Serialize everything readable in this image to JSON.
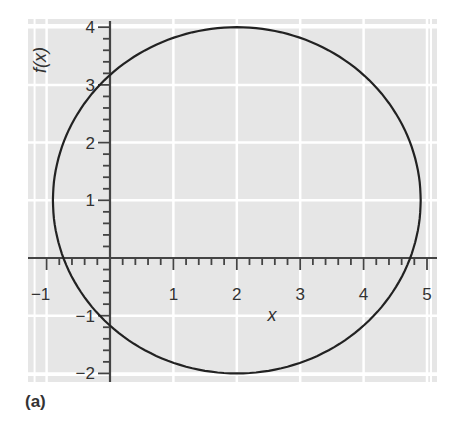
{
  "chart_data": {
    "type": "line",
    "title": "",
    "panel_label": "(a)",
    "xlabel": "x",
    "ylabel": "f(x)",
    "xlim": [
      -1.3,
      5.2
    ],
    "ylim": [
      -2.15,
      4.15
    ],
    "x_ticks": [
      -1,
      1,
      2,
      3,
      4,
      5
    ],
    "x_tick_labels": [
      "−1",
      "1",
      "2",
      "3",
      "4",
      "5"
    ],
    "y_ticks": [
      4,
      3,
      2,
      1,
      -1,
      -2
    ],
    "y_tick_labels": [
      "4",
      "3",
      "2",
      "1",
      "−1",
      "−2"
    ],
    "minor_tick_step": 0.2,
    "grid": true,
    "legend": null,
    "series": [
      {
        "name": "ellipse",
        "shape": "ellipse",
        "center": [
          2,
          1
        ],
        "radius_x": 2.9,
        "radius_y": 3,
        "color": "#222222",
        "key_points": [
          {
            "x": -0.9,
            "y": 1
          },
          {
            "x": 4.9,
            "y": 1
          },
          {
            "x": 2,
            "y": 4
          },
          {
            "x": 2,
            "y": -2
          },
          {
            "x": 0,
            "y": 3.2
          },
          {
            "x": 0,
            "y": -1.2
          },
          {
            "x": -0.8,
            "y": 0
          },
          {
            "x": 4.8,
            "y": 0
          }
        ]
      }
    ]
  },
  "colors": {
    "plot_background": "#e6e6e6",
    "grid": "#ffffff",
    "axis": "#444444",
    "curve": "#222222",
    "text": "#333333"
  }
}
